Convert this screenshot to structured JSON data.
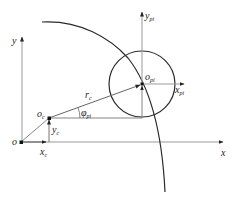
{
  "diagram": {
    "title": "",
    "colors": {
      "axis": "#9a9a9a",
      "curve": "#2a2a2a",
      "vector": "#555555",
      "text": "#222222"
    },
    "global_frame": {
      "origin_label": "o",
      "x_axis_label": "x",
      "y_axis_label": "y"
    },
    "center_point": {
      "label": "o",
      "label_sub": "c",
      "x_offset_label": "x",
      "x_offset_sub": "c",
      "y_offset_label": "y",
      "y_offset_sub": "c"
    },
    "radius_vector": {
      "label": "r",
      "label_sub": "c"
    },
    "angle": {
      "label": "φ",
      "label_sub": "pi"
    },
    "local_frame": {
      "origin_label": "o",
      "origin_sub": "pi",
      "x_axis_label": "x",
      "x_axis_sub": "pi",
      "y_axis_label": "y",
      "y_axis_sub": "pi"
    },
    "elements": [
      {
        "type": "axis",
        "name": "global-x-axis",
        "from": [
          21,
          142
        ],
        "to": [
          224,
          142
        ]
      },
      {
        "type": "axis",
        "name": "global-y-axis",
        "from": [
          22,
          142
        ],
        "to": [
          22,
          38
        ]
      },
      {
        "type": "arc",
        "name": "large-arc",
        "from": [
          42,
          22
        ],
        "to": [
          165,
          192
        ]
      },
      {
        "type": "circle",
        "name": "small-circle",
        "center": [
          142,
          84
        ],
        "radius": 33
      },
      {
        "type": "vector",
        "name": "r-c",
        "from": [
          49,
          118
        ],
        "to": [
          142,
          84
        ]
      },
      {
        "type": "axis",
        "name": "local-x-axis",
        "from": [
          142,
          84
        ],
        "to": [
          183,
          84
        ]
      },
      {
        "type": "axis",
        "name": "local-y-axis",
        "from": [
          142,
          84
        ],
        "to": [
          142,
          13
        ]
      }
    ]
  }
}
